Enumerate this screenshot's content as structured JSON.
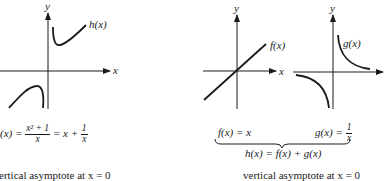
{
  "figure": {
    "left_plot": {
      "axis_x_label": "x",
      "axis_y_label": "y",
      "curve_label": "h(x)"
    },
    "middle_plot": {
      "axis_x_label": "x",
      "axis_y_label": "y",
      "curve_label": "f(x)"
    },
    "right_plot": {
      "axis_y_label": "y",
      "curve_label": "g(x)"
    },
    "left_formula": {
      "lhs": "(x) =",
      "frac1_num": "x² + 1",
      "frac1_den": "x",
      "mid": "= x +",
      "frac2_num": "1",
      "frac2_den": "x"
    },
    "f_formula": "f(x) = x",
    "g_formula": {
      "lhs": "g(x) =",
      "num": "1",
      "den": "x"
    },
    "sum_formula": "h(x) = f(x) + g(x)",
    "left_caption": "ertical asymptote at x = 0",
    "right_caption": "vertical asymptote at x = 0"
  },
  "colors": {
    "ink": "#1a1a1a",
    "background": "#ffffff"
  }
}
